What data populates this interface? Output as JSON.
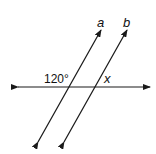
{
  "diagram": {
    "type": "parallel lines cut by transversal",
    "lines": [
      {
        "name": "a",
        "label": "a"
      },
      {
        "name": "b",
        "label": "b"
      }
    ],
    "transversal": {
      "orientation": "horizontal"
    },
    "angles": [
      {
        "label": "120°",
        "position": "above transversal, left of line a"
      },
      {
        "label": "x",
        "position": "above transversal, right of line b"
      }
    ],
    "colors": {
      "stroke": "#1a1a1a",
      "background": "#ffffff"
    }
  }
}
